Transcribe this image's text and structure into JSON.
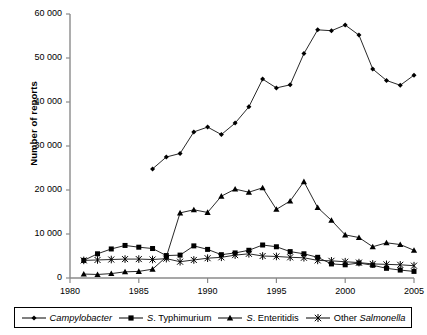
{
  "chart_data": {
    "type": "line",
    "title": "",
    "xlabel": "",
    "ylabel": "Number of reports",
    "xlim": [
      1980,
      2005
    ],
    "ylim": [
      0,
      60000
    ],
    "xticks": [
      1980,
      1985,
      1990,
      1995,
      2000,
      2005
    ],
    "ytick_labels": [
      "0",
      "10 000",
      "20 000",
      "30 000",
      "40 000",
      "50 000",
      "60 000"
    ],
    "yticks": [
      0,
      10000,
      20000,
      30000,
      40000,
      50000,
      60000
    ],
    "grid": false,
    "legend_position": "bottom",
    "series": [
      {
        "name": "Campylobacter",
        "name_italic": true,
        "marker": "diamond",
        "x": [
          1986,
          1987,
          1988,
          1989,
          1990,
          1991,
          1992,
          1993,
          1994,
          1995,
          1996,
          1997,
          1998,
          1999,
          2000,
          2001,
          2002,
          2003,
          2004,
          2005
        ],
        "values": [
          24800,
          27500,
          28300,
          33200,
          34300,
          32600,
          35200,
          38900,
          45200,
          43200,
          43900,
          51000,
          56400,
          56200,
          57500,
          55200,
          47500,
          44900,
          43800,
          46100
        ]
      },
      {
        "name": "S. Typhimurium",
        "name_italic": false,
        "marker": "square",
        "x": [
          1981,
          1982,
          1983,
          1984,
          1985,
          1986,
          1987,
          1988,
          1989,
          1990,
          1991,
          1992,
          1993,
          1994,
          1995,
          1996,
          1997,
          1998,
          1999,
          2000,
          2001,
          2002,
          2003,
          2004,
          2005
        ],
        "values": [
          4000,
          5500,
          6600,
          7400,
          7000,
          6700,
          5100,
          5200,
          7300,
          6500,
          5300,
          5700,
          6300,
          7500,
          7100,
          6000,
          5500,
          4700,
          3200,
          3000,
          3400,
          2900,
          2200,
          1800,
          1500
        ]
      },
      {
        "name": "S. Enteritidis",
        "name_italic": false,
        "marker": "triangle",
        "x": [
          1981,
          1982,
          1983,
          1984,
          1985,
          1986,
          1987,
          1988,
          1989,
          1990,
          1991,
          1992,
          1993,
          1994,
          1995,
          1996,
          1997,
          1998,
          1999,
          2000,
          2001,
          2002,
          2003,
          2004,
          2005
        ],
        "values": [
          900,
          800,
          1000,
          1400,
          1500,
          2000,
          4800,
          14800,
          15500,
          14900,
          18600,
          20200,
          19500,
          20500,
          15600,
          17500,
          21900,
          16000,
          13100,
          9800,
          9200,
          7100,
          8000,
          7600,
          6300
        ]
      },
      {
        "name": "Other Salmonella",
        "name_italic": true,
        "marker": "star",
        "x": [
          1981,
          1982,
          1983,
          1984,
          1985,
          1986,
          1987,
          1988,
          1989,
          1990,
          1991,
          1992,
          1993,
          1994,
          1995,
          1996,
          1997,
          1998,
          1999,
          2000,
          2001,
          2002,
          2003,
          2004,
          2005
        ],
        "values": [
          4000,
          4100,
          4200,
          4300,
          4300,
          4200,
          4400,
          3700,
          4100,
          4500,
          4700,
          5200,
          5500,
          5000,
          4900,
          4700,
          4600,
          4000,
          3900,
          3700,
          3500,
          3200,
          3100,
          3000,
          2800
        ]
      }
    ]
  },
  "legend": {
    "items": [
      {
        "label": "Campylobacter",
        "marker": "diamond-icon"
      },
      {
        "label": "S. Typhimurium",
        "marker": "square-icon"
      },
      {
        "label": "S. Enteritidis",
        "marker": "triangle-icon"
      },
      {
        "label": "Other Salmonella",
        "marker": "star-icon"
      }
    ]
  },
  "colors": {
    "series_line": "#000000",
    "axis": "#808080",
    "background": "#ffffff"
  }
}
